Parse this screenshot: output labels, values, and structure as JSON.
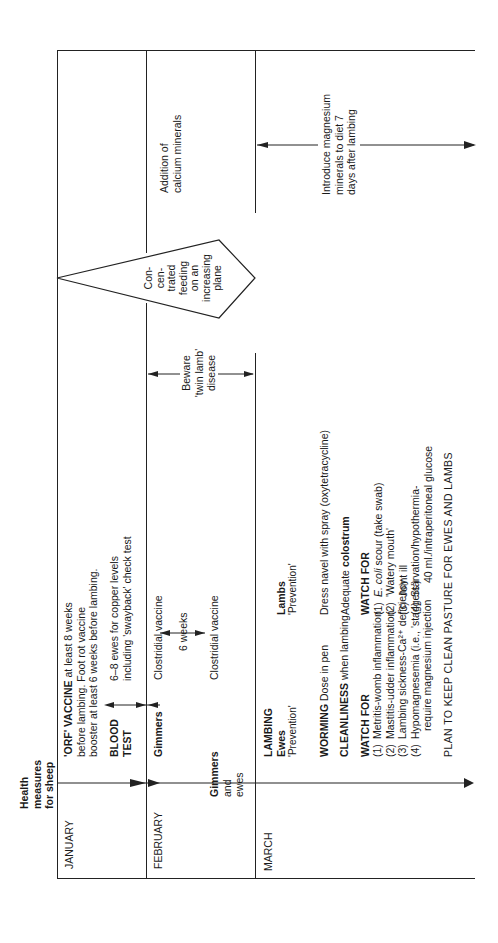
{
  "title": {
    "lines": [
      "Health",
      "measures",
      "for sheep"
    ]
  },
  "months": [
    {
      "label": "JANUARY"
    },
    {
      "label": "FEBRUARY"
    },
    {
      "label": "MARCH"
    }
  ],
  "january": {
    "orf_bold": "'ORF' VACCINE",
    "orf_rest": " at least 8 weeks",
    "orf_line2": "before lambing. Foot rot vaccine",
    "orf_line3": "booster at least 6 weeks before lambing.",
    "blood_test_line1": "BLOOD",
    "blood_test_line2": "TEST",
    "copper_line1": "6–8 ewes for copper levels",
    "copper_line2": "including 'swayback' check test"
  },
  "february": {
    "gimmers": "Gimmers",
    "clostridial_1": "Clostridial vaccine",
    "interval": "6 weeks",
    "gimmers_and_ewes": [
      "Gimmers",
      "and",
      "ewes"
    ],
    "clostridial_2": "Clostridial vaccine",
    "twin_lamb": [
      "Beware",
      "'twin lamb'",
      "disease"
    ],
    "concentrated_feeding": [
      "Con-",
      "cen-",
      "trated",
      "feeding",
      "on an",
      "increasing",
      "plane"
    ],
    "calcium": [
      "Addition of",
      "calcium minerals"
    ]
  },
  "march": {
    "lambing": "LAMBING",
    "ewes": {
      "heading": "Ewes",
      "subheading": "'Prevention'",
      "worming_bold": "WORMING",
      "worming_rest": " Dose in pen",
      "cleanliness_bold": "CLEANLINESS",
      "cleanliness_rest": " when lambing",
      "watch_for": "WATCH FOR",
      "items": [
        {
          "num": "(1)",
          "text": "Metritis-womb inflammation"
        },
        {
          "num": "(2)",
          "text": "Mastitis-udder inflammation"
        },
        {
          "num": "(3)",
          "text": "Lambing sickness-Ca²⁺ deficiency"
        },
        {
          "num": "(4)",
          "text": "Hypomagnesemia (i.e., 'staggers')"
        }
      ],
      "item4_cont": "require magnesium injection"
    },
    "lambs": {
      "heading": "Lambs",
      "subheading": "'Prevention'",
      "dress_navel": "Dress navel with spray (oxytetracycline)",
      "colostrum_pre": "Adequate ",
      "colostrum_bold": "colostrum",
      "watch_for": "WATCH FOR",
      "items": [
        {
          "num": "(1)",
          "italic": "E. coli",
          "text": " scour (take swab)"
        },
        {
          "num": "(2)",
          "italic": "",
          "text": "'Watery mouth'"
        },
        {
          "num": "(3)",
          "italic": "",
          "text": "Joint ill"
        },
        {
          "num": "(4)",
          "italic": "",
          "text": "Starvation/hypothermia-"
        }
      ],
      "item4_cont": "40 ml./intraperitoneal glucose"
    },
    "magnesium": [
      "Introduce magnesium",
      "minerals to diet 7",
      "days after lambing"
    ],
    "plan": "PLAN TO KEEP CLEAN PASTURE FOR EWES AND LAMBS"
  },
  "colors": {
    "line": "#222222",
    "text": "#1a1a1a",
    "background": "#ffffff"
  }
}
